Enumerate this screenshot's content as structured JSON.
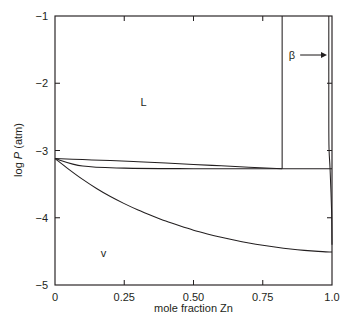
{
  "chart_data": {
    "type": "line",
    "title": "",
    "xlabel": "mole fraction Zn",
    "ylabel": "log P (atm)",
    "ylabel_prefix": "log ",
    "ylabel_italic": "P",
    "ylabel_suffix": " (atm)",
    "xlim": [
      0,
      1.0
    ],
    "ylim": [
      -5,
      -1
    ],
    "x_ticks": [
      0,
      0.25,
      0.5,
      0.75,
      1.0
    ],
    "x_tick_labels": [
      "0",
      "0.25",
      "0.50",
      "0.75",
      "1.0"
    ],
    "y_ticks": [
      -1,
      -2,
      -3,
      -4,
      -5
    ],
    "y_tick_labels": [
      "−1",
      "−2",
      "−3",
      "−4",
      "−5"
    ],
    "grid": false,
    "legend": null,
    "annotations": [
      {
        "text": "L",
        "x": 0.32,
        "y": -2.28,
        "name": "liquid-region-label"
      },
      {
        "text": "v",
        "x": 0.175,
        "y": -4.52,
        "name": "vapor-region-label"
      },
      {
        "text": "β",
        "x": 0.855,
        "y": -1.58,
        "name": "beta-region-label"
      }
    ],
    "series": [
      {
        "name": "liquidus",
        "comment": "upper boundary of L+v field, from pure Cd vapor pressure down to peritectic",
        "points": [
          [
            0.0,
            -3.12
          ],
          [
            0.1,
            -3.135
          ],
          [
            0.2,
            -3.15
          ],
          [
            0.3,
            -3.168
          ],
          [
            0.4,
            -3.187
          ],
          [
            0.5,
            -3.207
          ],
          [
            0.6,
            -3.228
          ],
          [
            0.7,
            -3.249
          ],
          [
            0.78,
            -3.264
          ],
          [
            0.82,
            -3.272
          ]
        ]
      },
      {
        "name": "tie-line-horizontal",
        "comment": "invariant horizontal at log P = -3.27 spanning full composition range",
        "points": [
          [
            0.0,
            -3.12
          ],
          [
            0.1,
            -3.232
          ],
          [
            0.25,
            -3.262
          ],
          [
            0.5,
            -3.27
          ],
          [
            0.82,
            -3.272
          ],
          [
            1.0,
            -3.272
          ]
        ]
      },
      {
        "name": "vapor-curve",
        "comment": "lower boundary of L+v field, concave-up descending to Zn-rich corner",
        "points": [
          [
            0.0,
            -3.12
          ],
          [
            0.05,
            -3.28
          ],
          [
            0.1,
            -3.43
          ],
          [
            0.15,
            -3.565
          ],
          [
            0.2,
            -3.685
          ],
          [
            0.25,
            -3.79
          ],
          [
            0.3,
            -3.885
          ],
          [
            0.35,
            -3.97
          ],
          [
            0.4,
            -4.05
          ],
          [
            0.45,
            -4.12
          ],
          [
            0.5,
            -4.185
          ],
          [
            0.55,
            -4.24
          ],
          [
            0.6,
            -4.29
          ],
          [
            0.65,
            -4.335
          ],
          [
            0.7,
            -4.375
          ],
          [
            0.75,
            -4.41
          ],
          [
            0.8,
            -4.44
          ],
          [
            0.85,
            -4.465
          ],
          [
            0.9,
            -4.485
          ],
          [
            0.95,
            -4.5
          ],
          [
            1.0,
            -4.51
          ]
        ]
      },
      {
        "name": "beta-left-boundary",
        "comment": "vertical phase boundary at x = 0.82 from top of frame to tie-line",
        "points": [
          [
            0.82,
            -1.0
          ],
          [
            0.82,
            -3.272
          ]
        ]
      },
      {
        "name": "beta-sliver-boundary",
        "comment": "near-vertical narrow beta field edge close to pure Zn",
        "points": [
          [
            0.9885,
            -1.0
          ],
          [
            0.9885,
            -2.6
          ],
          [
            0.9895,
            -3.0
          ],
          [
            0.993,
            -3.272
          ],
          [
            0.9985,
            -3.9
          ],
          [
            1.0,
            -4.4
          ]
        ]
      }
    ]
  },
  "beta_arrow": {
    "name": "beta-pointer-arrow",
    "from_x": 0.885,
    "to_x": 0.982,
    "y": -1.58
  },
  "frame": {
    "left": 55,
    "right": 332,
    "top": 16,
    "bottom": 285
  }
}
